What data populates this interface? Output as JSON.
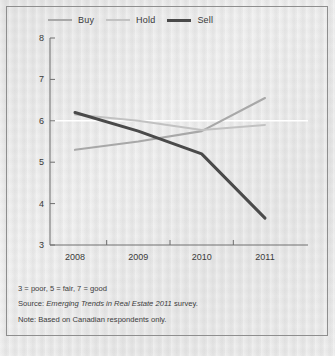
{
  "chart_data": {
    "type": "line",
    "title": "",
    "subtitle": "",
    "xlabel": "",
    "ylabel": "",
    "categories": [
      "2008",
      "2009",
      "2010",
      "2011"
    ],
    "x": [
      2008,
      2009,
      2010,
      2011
    ],
    "xlim": [
      2007.7,
      2011.3
    ],
    "ylim": [
      3,
      8
    ],
    "yticks": [
      3,
      4,
      5,
      6,
      7,
      8
    ],
    "ytick_labels": [
      "3",
      "4",
      "5",
      "6",
      "7",
      "8"
    ],
    "xtick_labels": [
      "2008",
      "2009",
      "2010",
      "2011"
    ],
    "grid": false,
    "gridlines_y": [
      6
    ],
    "legend_position": "top-left",
    "series": [
      {
        "name": "Buy",
        "color": "#a8a8a8",
        "width": 2.2,
        "values": [
          5.3,
          5.5,
          5.75,
          6.55
        ]
      },
      {
        "name": "Hold",
        "color": "#c2c2c2",
        "width": 2.0,
        "values": [
          6.15,
          6.0,
          5.78,
          5.9
        ]
      },
      {
        "name": "Sell",
        "color": "#4a4a4a",
        "width": 3.0,
        "values": [
          6.2,
          5.75,
          5.2,
          3.65
        ]
      }
    ]
  },
  "legend": {
    "items": [
      {
        "label": "Buy",
        "color": "#a8a8a8",
        "width": "2px"
      },
      {
        "label": "Hold",
        "color": "#c2c2c2",
        "width": "2px"
      },
      {
        "label": "Sell",
        "color": "#4a4a4a",
        "width": "3px"
      }
    ]
  },
  "axes": {
    "y_ticks": [
      "8",
      "7",
      "6",
      "5",
      "4",
      "3"
    ],
    "x_ticks": [
      "2008",
      "2009",
      "2010",
      "2011"
    ],
    "axis_color": "#6e6e6e"
  },
  "footnotes": {
    "scale": "3 = poor,  5 =  fair, 7 = good",
    "source_prefix": "Source: ",
    "source_italic": "Emerging Trends in Real Estate 2011",
    "source_suffix": " survey.",
    "note": "Note: Based on Canadian respondents only."
  },
  "colors": {
    "background": "#e9e9e9",
    "frame": "#8e8e8e",
    "text": "#3a3a3a",
    "gridline": "#ffffff"
  }
}
